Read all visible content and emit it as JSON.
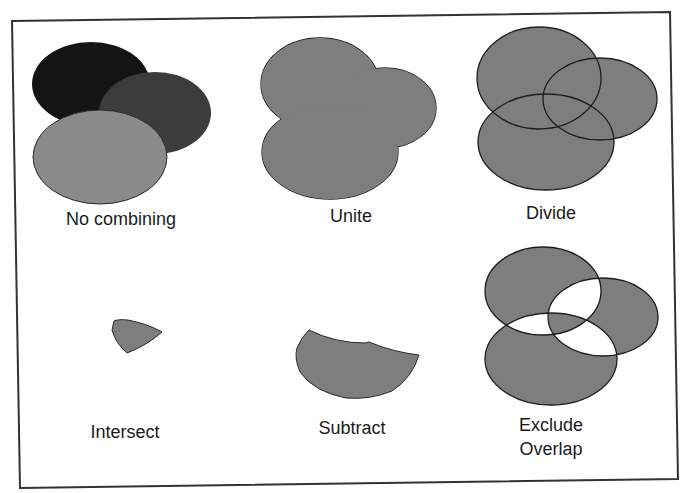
{
  "diagram": {
    "colors": {
      "background": "#ffffff",
      "frame": "#333333",
      "black_shape": "#141414",
      "dark_gray_shape": "#3c3c3c",
      "light_gray_shape": "#8a8a8a",
      "combined_fill": "#7e7e7e",
      "outline": "#1e1e1e",
      "label": "#1a1a1a"
    },
    "panels": [
      {
        "id": "no-combining",
        "label": "No combining"
      },
      {
        "id": "unite",
        "label": "Unite"
      },
      {
        "id": "divide",
        "label": "Divide"
      },
      {
        "id": "intersect",
        "label": "Intersect"
      },
      {
        "id": "subtract",
        "label": "Subtract"
      },
      {
        "id": "exclude-overlap",
        "label_line1": "Exclude",
        "label_line2": "Overlap"
      }
    ]
  }
}
